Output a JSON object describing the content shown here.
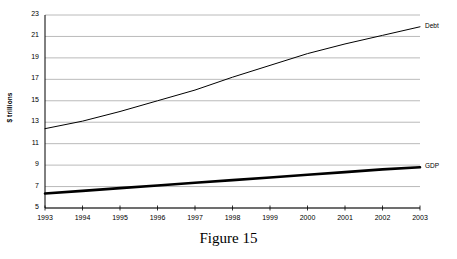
{
  "caption": "Figure 15",
  "chart_data": {
    "type": "line",
    "title": "",
    "subtitle": "",
    "xlabel": "",
    "ylabel": "$ trillions",
    "x": [
      1993,
      1994,
      1995,
      1996,
      1997,
      1998,
      1999,
      2000,
      2001,
      2002,
      2003
    ],
    "categories": [
      "1993",
      "1994",
      "1995",
      "1996",
      "1997",
      "1998",
      "1999",
      "2000",
      "2001",
      "2002",
      "2003"
    ],
    "xlim": [
      1993,
      2003
    ],
    "ylim": [
      5,
      23
    ],
    "yticks": [
      5,
      7,
      9,
      11,
      13,
      15,
      17,
      19,
      21,
      23
    ],
    "ytick_labels": [
      "5",
      "7",
      "9",
      "11",
      "13",
      "15",
      "17",
      "19",
      "21",
      "23"
    ],
    "grid": "horizontal",
    "legend": "inline-end-labels",
    "series": [
      {
        "name": "Debt",
        "label": "Debt",
        "color": "#000000",
        "line_width": 1,
        "values": [
          12.4,
          13.1,
          14.0,
          15.0,
          16.0,
          17.2,
          18.3,
          19.4,
          20.3,
          21.1,
          21.9
        ]
      },
      {
        "name": "GDP",
        "label": "GDP",
        "color": "#000000",
        "line_width": 2.6,
        "values": [
          6.35,
          6.6,
          6.85,
          7.1,
          7.35,
          7.6,
          7.85,
          8.1,
          8.35,
          8.6,
          8.8
        ]
      }
    ],
    "colors": {
      "axis": "#000000",
      "gridline": "#a8a8a8",
      "background": "#ffffff",
      "text": "#000000"
    }
  }
}
